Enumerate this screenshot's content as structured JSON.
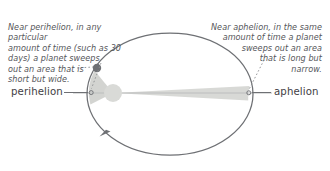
{
  "figure": {
    "background_color": "#ffffff"
  },
  "annotations": {
    "perihelion_note": "Near perihelion, in any particular\namount of time (such as 30\ndays) a planet sweeps\nout an area that is\nshort but wide.",
    "aphelion_note": "Near aphelion, in the same\namount of time a planet\nsweeps out an area\nthat is long but\nnarrow."
  },
  "labels": {
    "perihelion": "perihelion",
    "aphelion": "aphelion"
  },
  "colors": {
    "orbit_stroke": "#6e7074",
    "sector_fill": "#d2d3d0",
    "sector_fill_far": "#d7d8d5",
    "sun_fill": "#d9dad7",
    "planet_fill": "#6f7175",
    "text": "#55565a",
    "label_text": "#3f4044",
    "leader_line": "#8b8d90",
    "major_axis": "#b9babb"
  },
  "geometry": {
    "ellipse_center_x": 170,
    "ellipse_center_y": 94,
    "ellipse_radius_x": 83,
    "ellipse_radius_y": 61,
    "sun_x": 113,
    "sun_y": 93,
    "sun_radius": 9,
    "planet_x": 97,
    "planet_y": 68,
    "planet_radius": 4.2,
    "perihelion_point_x": 89,
    "perihelion_point_y": 93,
    "aphelion_point_x": 248,
    "aphelion_point_y": 93,
    "orbit_direction": "counterclockwise"
  }
}
